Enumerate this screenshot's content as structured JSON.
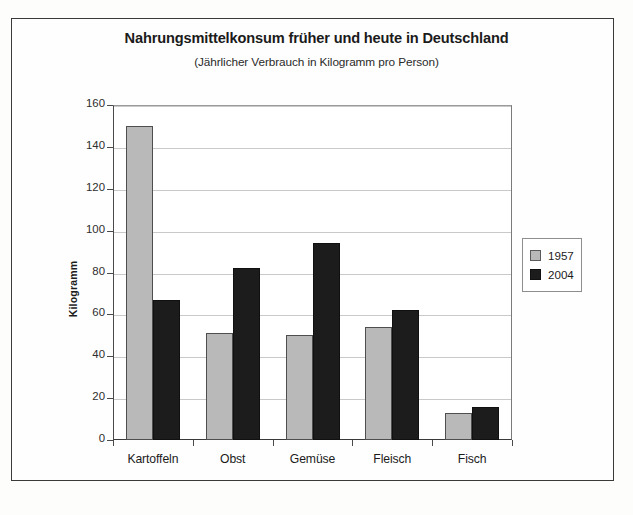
{
  "chart_data": {
    "type": "bar",
    "title": "Nahrungsmittelkonsum früher und heute in Deutschland",
    "subtitle": "(Jährlicher Verbrauch in Kilogramm pro Person)",
    "xlabel": "",
    "ylabel": "Kilogramm",
    "categories": [
      "Kartoffeln",
      "Obst",
      "Gemüse",
      "Fleisch",
      "Fisch"
    ],
    "series": [
      {
        "name": "1957",
        "color": "#b9b9b9",
        "values": [
          150,
          51,
          50,
          54,
          13
        ]
      },
      {
        "name": "2004",
        "color": "#1c1c1c",
        "values": [
          67,
          82,
          94,
          62,
          16
        ]
      }
    ],
    "ylim": [
      0,
      160
    ],
    "yticks": [
      0,
      20,
      40,
      60,
      80,
      100,
      120,
      140,
      160
    ],
    "ytick_labels": [
      "0",
      "20",
      "40",
      "60",
      "80",
      "100",
      "120",
      "140",
      "160"
    ],
    "grid": true,
    "legend_position": "right"
  },
  "legend": {
    "entries": [
      {
        "label": "1957",
        "swatch": "gray-swatch"
      },
      {
        "label": "2004",
        "swatch": "black-swatch"
      }
    ]
  },
  "colors": {
    "series_1957": "#b9b9b9",
    "series_2004": "#1c1c1c",
    "grid": "#c9c9c9",
    "axis": "#3a3a3a",
    "text": "#1b1b1b",
    "frame": "#3a3a3a"
  }
}
